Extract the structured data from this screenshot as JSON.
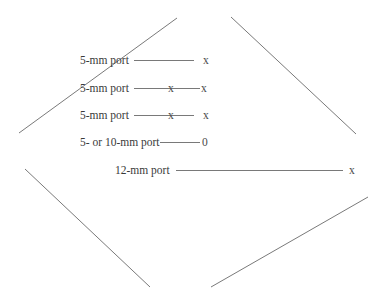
{
  "diagram": {
    "type": "port-placement",
    "colors": {
      "stroke": "#6a6a6a",
      "text": "#3a3a3a"
    },
    "outline_lines": [
      {
        "name": "upper-left",
        "x1": 19,
        "y1": 133,
        "x2": 177,
        "y2": 18
      },
      {
        "name": "upper-right",
        "x1": 231,
        "y1": 17,
        "x2": 356,
        "y2": 134
      },
      {
        "name": "lower-left",
        "x1": 25,
        "y1": 169,
        "x2": 150,
        "y2": 287
      },
      {
        "name": "lower-right",
        "x1": 211,
        "y1": 287,
        "x2": 368,
        "y2": 197
      }
    ],
    "rows": [
      {
        "label": "5-mm port",
        "label_x": 80,
        "y": 64,
        "line_x1": 134,
        "line_x2": 194,
        "markers": [
          {
            "text": "x",
            "x": 203
          }
        ]
      },
      {
        "label": "5-mm port",
        "label_x": 80,
        "y": 92,
        "line_x1": 134,
        "line_x2": 200,
        "markers": [
          {
            "text": "x",
            "x": 168
          },
          {
            "text": "x",
            "x": 201
          }
        ]
      },
      {
        "label": "5-mm port",
        "label_x": 80,
        "y": 119,
        "line_x1": 134,
        "line_x2": 194,
        "markers": [
          {
            "text": "x",
            "x": 168
          },
          {
            "text": "x",
            "x": 203
          }
        ]
      },
      {
        "label": "5- or 10-mm port",
        "label_x": 80,
        "y": 146,
        "line_x1": 160,
        "line_x2": 200,
        "markers": [
          {
            "text": "0",
            "x": 202
          }
        ]
      },
      {
        "label": "12-mm port",
        "label_x": 115,
        "y": 174,
        "line_x1": 176,
        "line_x2": 343,
        "markers": [
          {
            "text": "x",
            "x": 349
          }
        ]
      }
    ]
  }
}
